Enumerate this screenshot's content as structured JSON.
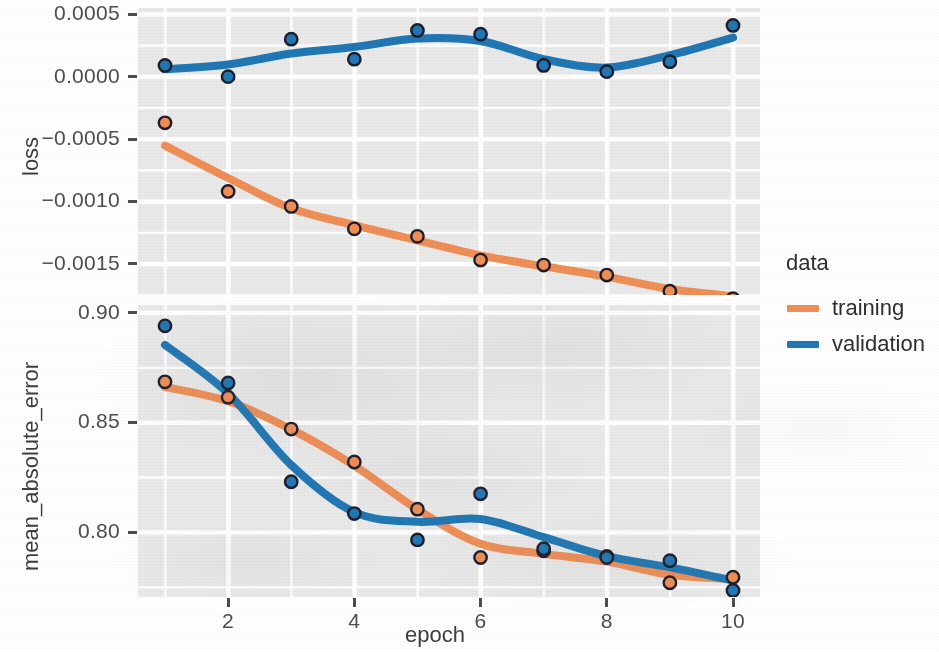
{
  "axes": {
    "x_title": "epoch",
    "x_ticks": [
      "2",
      "4",
      "6",
      "8",
      "10"
    ],
    "panel_top_title": "loss",
    "panel_top_ticks": [
      "0.0005",
      "0.0000",
      "−0.0005",
      "−0.0010",
      "−0.0015"
    ],
    "panel_bottom_title": "mean_absolute_error",
    "panel_bottom_ticks": [
      "0.90",
      "0.85",
      "0.80"
    ]
  },
  "legend": {
    "title": "data",
    "items": [
      {
        "label": "training",
        "color": "#ef8e56"
      },
      {
        "label": "validation",
        "color": "#2077b4"
      }
    ]
  },
  "colors": {
    "training": "#ef8e56",
    "validation": "#2077b4",
    "panel_background": "#e9e9e9",
    "grid": "#ffffff",
    "point_outline": "#1d1d2b",
    "axis_text": "#4d4d4d"
  },
  "chart_data": [
    {
      "type": "line",
      "title": "loss",
      "xlabel": "epoch",
      "ylabel": "loss",
      "xlim": [
        1,
        10
      ],
      "ylim": [
        -0.00175,
        0.00055
      ],
      "grid": true,
      "legend_position": "right",
      "x": [
        1,
        2,
        3,
        4,
        5,
        6,
        7,
        8,
        9,
        10
      ],
      "yticks": [
        0.0005,
        0.0,
        -0.0005,
        -0.001,
        -0.0015
      ],
      "series": [
        {
          "name": "training",
          "color": "#ef8e56",
          "values": [
            -0.00037,
            -0.00092,
            -0.00104,
            -0.00122,
            -0.00128,
            -0.00147,
            -0.00151,
            -0.00159,
            -0.00172,
            -0.00178
          ]
        },
        {
          "name": "validation",
          "color": "#2077b4",
          "values": [
            9e-05,
            0.0,
            0.0003,
            0.00014,
            0.00037,
            0.00034,
            9e-05,
            4e-05,
            0.00012,
            0.00041
          ]
        }
      ]
    },
    {
      "type": "line",
      "title": "mean_absolute_error",
      "xlabel": "epoch",
      "ylabel": "mean_absolute_error",
      "xlim": [
        1,
        10
      ],
      "ylim": [
        0.7705,
        0.9035
      ],
      "grid": true,
      "legend_position": "right",
      "x": [
        1,
        2,
        3,
        4,
        5,
        6,
        7,
        8,
        9,
        10
      ],
      "yticks": [
        0.9,
        0.85,
        0.8
      ],
      "series": [
        {
          "name": "training",
          "color": "#ef8e56",
          "values": [
            0.8685,
            0.8615,
            0.847,
            0.832,
            0.8105,
            0.7885,
            0.7915,
            0.789,
            0.777,
            0.7795
          ]
        },
        {
          "name": "validation",
          "color": "#2077b4",
          "values": [
            0.894,
            0.868,
            0.823,
            0.8085,
            0.7965,
            0.8175,
            0.7925,
            0.7885,
            0.787,
            0.7735
          ]
        }
      ]
    }
  ]
}
